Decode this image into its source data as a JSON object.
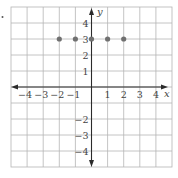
{
  "chart_data": {
    "type": "scatter",
    "title": "",
    "xlabel": "x",
    "ylabel": "y",
    "xlim": [
      -5,
      5
    ],
    "ylim": [
      -5,
      5
    ],
    "grid": true,
    "x_ticks": [
      -4,
      -3,
      -2,
      -1,
      1,
      2,
      3,
      4
    ],
    "x_tick_labels": [
      "−4",
      "−3",
      "−2",
      "−1",
      "1",
      "2",
      "3",
      "4"
    ],
    "y_ticks": [
      4,
      3,
      2,
      1,
      -2,
      -3,
      -4
    ],
    "y_tick_labels": [
      "4",
      "3",
      "2",
      "1",
      "−2",
      "−3",
      "−4"
    ],
    "series": [
      {
        "name": "points",
        "points": [
          {
            "x": -2,
            "y": 3
          },
          {
            "x": -1,
            "y": 3
          },
          {
            "x": 0,
            "y": 3
          },
          {
            "x": 1,
            "y": 3
          },
          {
            "x": 2,
            "y": 3
          }
        ],
        "color": "#707070"
      }
    ],
    "colors": {
      "grid": "#b5b5b5",
      "axis": "#2b2b2b",
      "point": "#707070",
      "label": "#444444"
    }
  }
}
